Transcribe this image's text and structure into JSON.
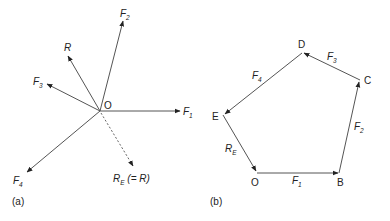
{
  "panel_a": {
    "caption": "(a)",
    "origin_label": "O",
    "forces": [
      {
        "name": "F",
        "sub": "1"
      },
      {
        "name": "F",
        "sub": "2"
      },
      {
        "name": "F",
        "sub": "3"
      },
      {
        "name": "F",
        "sub": "4"
      }
    ],
    "resultant": {
      "name": "R"
    },
    "equilibrant": {
      "name": "R",
      "sub": "E",
      "suffix": " (= R)"
    }
  },
  "panel_b": {
    "caption": "(b)",
    "vertices": [
      "O",
      "B",
      "C",
      "D",
      "E"
    ],
    "sides": [
      {
        "name": "F",
        "sub": "1"
      },
      {
        "name": "F",
        "sub": "2"
      },
      {
        "name": "F",
        "sub": "3"
      },
      {
        "name": "F",
        "sub": "4"
      },
      {
        "name": "R",
        "sub": "E"
      }
    ]
  }
}
